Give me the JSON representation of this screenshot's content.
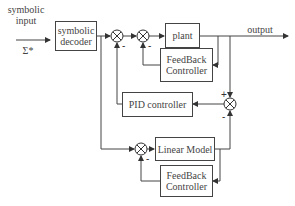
{
  "diagram": {
    "input": {
      "label_line1": "symbolic",
      "label_line2": "input",
      "symbol": "Σ*"
    },
    "output": {
      "label": "output"
    },
    "blocks": {
      "symbolic_decoder": {
        "line1": "symbolic",
        "line2": "decoder"
      },
      "plant": {
        "label": "plant"
      },
      "feedback_controller_top": {
        "line1": "FeedBack",
        "line2": "Controller"
      },
      "pid_controller": {
        "label": "PID controller"
      },
      "linear_model": {
        "label": "Linear Model"
      },
      "feedback_controller_bottom": {
        "line1": "FeedBack",
        "line2": "Controller"
      }
    },
    "junction_signs": {
      "j1_minus": "-",
      "j2_minus": "-",
      "j3_plus": "+",
      "j3_minus": "-",
      "j4_minus": "-"
    },
    "colors": {
      "stroke": "#444444",
      "background": "#ffffff"
    }
  }
}
